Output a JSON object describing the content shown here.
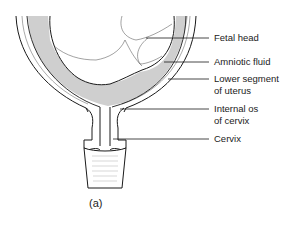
{
  "figure": {
    "caption": "(a)",
    "colors": {
      "line": "#1a1a1a",
      "fluid": "#cfcfcf",
      "background": "#ffffff"
    }
  },
  "labels": {
    "fetal_head": "Fetal head",
    "amniotic_fluid": "Amniotic fluid",
    "lower_segment_1": "Lower segment",
    "lower_segment_2": "of uterus",
    "internal_os_1": "Internal os",
    "internal_os_2": "of cervix",
    "cervix": "Cervix"
  }
}
